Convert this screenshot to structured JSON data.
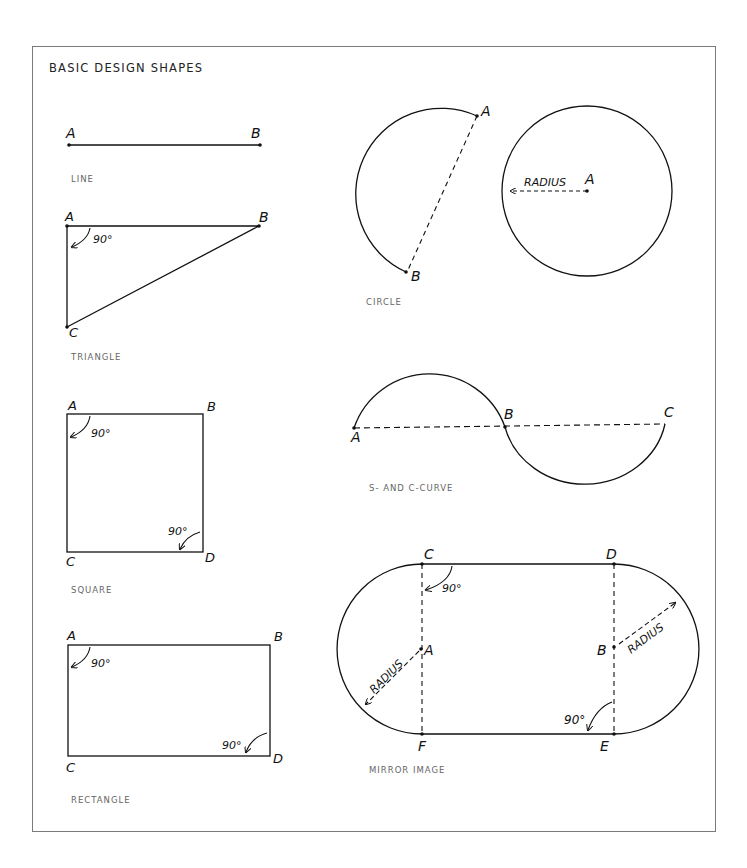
{
  "title": "BASIC DESIGN SHAPES",
  "captions": {
    "line": "LINE",
    "triangle": "TRIANGLE",
    "square": "SQUARE",
    "rectangle": "RECTANGLE",
    "circle": "CIRCLE",
    "curve": "S- AND C-CURVE",
    "mirror": "MIRROR IMAGE"
  },
  "labels": {
    "line": {
      "a": "A",
      "b": "B"
    },
    "triangle": {
      "a": "A",
      "b": "B",
      "c": "C",
      "angle": "90°"
    },
    "square": {
      "a": "A",
      "b": "B",
      "c": "C",
      "d": "D",
      "angle1": "90°",
      "angle2": "90°"
    },
    "rectangle": {
      "a": "A",
      "b": "B",
      "c": "C",
      "d": "D",
      "angle1": "90°",
      "angle2": "90°"
    },
    "circle_arc": {
      "a": "A",
      "b": "B"
    },
    "circle_full": {
      "a": "A",
      "radius": "RADIUS"
    },
    "curve": {
      "a": "A",
      "b": "B",
      "c": "C"
    },
    "mirror": {
      "a": "A",
      "b": "B",
      "c": "C",
      "d": "D",
      "e": "E",
      "f": "F",
      "angle1": "90°",
      "angle2": "90°",
      "radius1": "RADIUS",
      "radius2": "RADIUS"
    }
  },
  "colors": {
    "line": "#111111",
    "frame": "#7a7a7a",
    "caption": "#666666"
  }
}
